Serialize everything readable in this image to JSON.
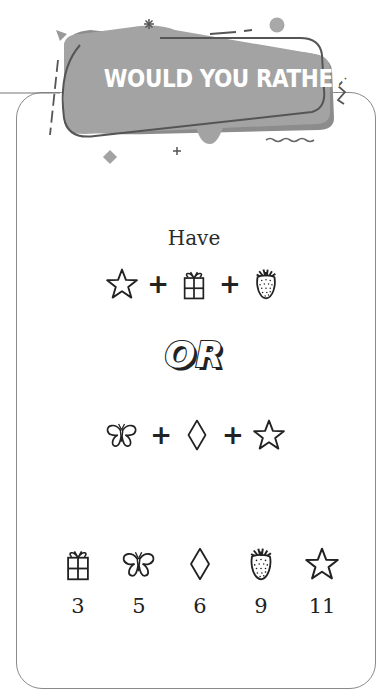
{
  "banner": {
    "title": "WOULD YOU RATHER"
  },
  "puzzle": {
    "prompt": "Have",
    "option_a": {
      "items": [
        "star",
        "gift",
        "strawberry"
      ],
      "operator": "+"
    },
    "separator": "OR",
    "option_b": {
      "items": [
        "butterfly",
        "diamond",
        "star"
      ],
      "operator": "+"
    }
  },
  "legend": [
    {
      "icon": "gift",
      "value": "3"
    },
    {
      "icon": "butterfly",
      "value": "5"
    },
    {
      "icon": "diamond",
      "value": "6"
    },
    {
      "icon": "strawberry",
      "value": "9"
    },
    {
      "icon": "star",
      "value": "11"
    }
  ],
  "colors": {
    "banner_fill": "#a3a3a3",
    "banner_shadow": "#8c8c8c",
    "card_border": "#8a8a8a",
    "text": "#222222"
  }
}
